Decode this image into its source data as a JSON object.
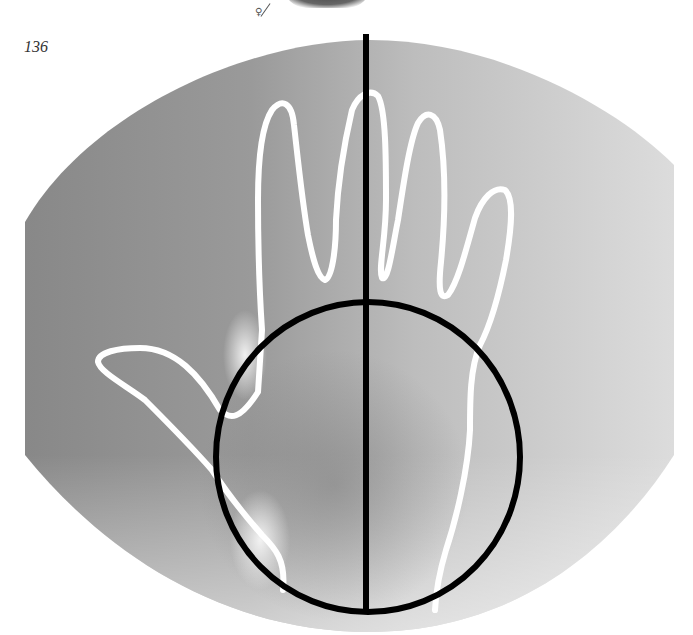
{
  "page": {
    "page_number": "136",
    "top_caption_fragment": "palmistry figure illustration",
    "symbol": "♀"
  },
  "figure": {
    "elements": [
      "background-gradient",
      "hand-outline",
      "vertical-line",
      "palm-oval"
    ],
    "colors": {
      "background_dark": "#8a8a8a",
      "background_light": "#dadada",
      "outline": "#ffffff",
      "lines": "#000000",
      "page": "#ffffff"
    }
  }
}
